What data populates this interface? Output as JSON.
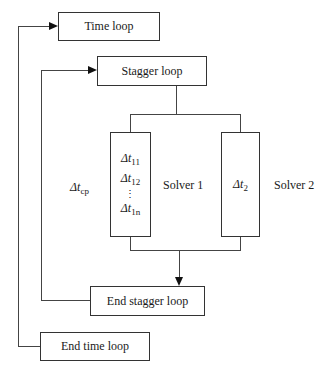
{
  "diagram": {
    "boxes": {
      "time_loop": "Time loop",
      "stagger_loop": "Stagger loop",
      "end_stagger_loop": "End stagger loop",
      "end_time_loop": "End time loop"
    },
    "solver1": {
      "label": "Solver 1",
      "steps": [
        {
          "symbol": "Δt",
          "sub": "11"
        },
        {
          "symbol": "Δt",
          "sub": "12"
        },
        {
          "symbol": "Δt",
          "sub": "1n"
        }
      ],
      "ellipsis": "⋮"
    },
    "solver2": {
      "label": "Solver 2",
      "step": {
        "symbol": "Δt",
        "sub": "2"
      }
    },
    "coupling": {
      "symbol": "Δt",
      "sub": "cp"
    }
  }
}
